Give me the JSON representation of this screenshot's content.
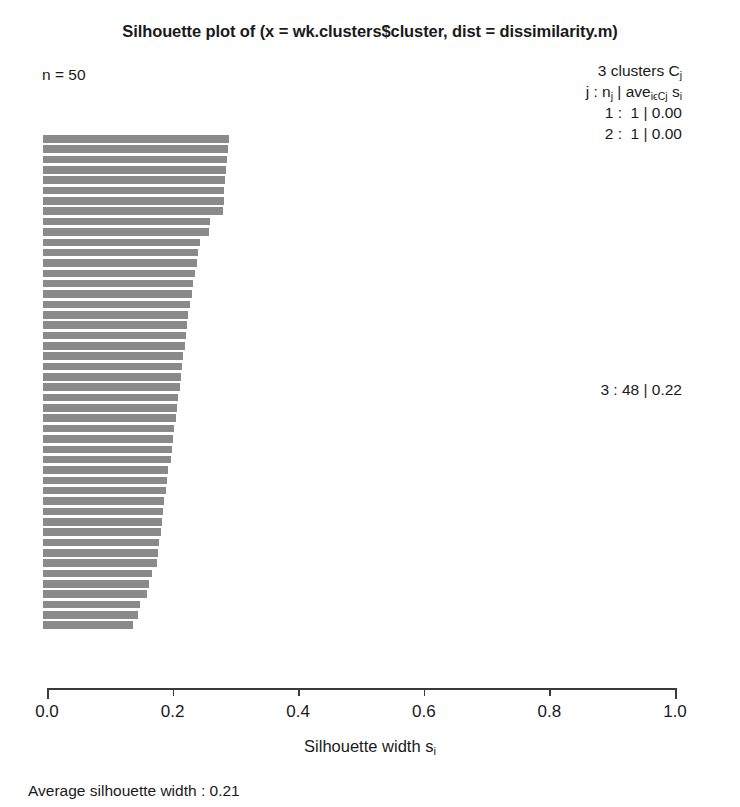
{
  "title": "Silhouette plot of (x = wk.clusters$cluster, dist = dissimilarity.m)",
  "n_label": "n = 50",
  "legend": {
    "header": "3 clusters C",
    "header_sub": "j",
    "formula_parts": [
      "j : n",
      "j",
      " | ave",
      "iϵCj",
      " s",
      "i"
    ],
    "rows": [
      {
        "label": "1 :  1 | 0.00",
        "cluster": 1,
        "size": 1,
        "avg": 0.0
      },
      {
        "label": "2 :  1 | 0.00",
        "cluster": 2,
        "size": 1,
        "avg": 0.0
      }
    ],
    "cluster3_label": "3 : 48 | 0.22",
    "cluster3": {
      "cluster": 3,
      "size": 48,
      "avg": 0.22
    }
  },
  "xlabel_main": "Silhouette width s",
  "xlabel_sub": "i",
  "average_label": "Average silhouette width : 0.21",
  "average_value": 0.21,
  "colors": {
    "bar": "#8a8a8a",
    "axis": "#3a3a3a",
    "text": "#1a1a1a",
    "background": "#ffffff"
  },
  "axis": {
    "ticks": [
      0.0,
      0.2,
      0.4,
      0.6,
      0.8,
      1.0
    ],
    "tick_labels": [
      "0.0",
      "0.2",
      "0.4",
      "0.6",
      "0.8",
      "1.0"
    ],
    "xlim": [
      0.0,
      1.0
    ],
    "grid": false
  },
  "chart_data": {
    "type": "bar",
    "orientation": "horizontal",
    "title": "Silhouette plot of (x = wk.clusters$cluster, dist = dissimilarity.m)",
    "xlabel": "Silhouette width s_i",
    "ylabel": "",
    "xlim": [
      0.0,
      1.0
    ],
    "grid": false,
    "n": 50,
    "n_clusters": 3,
    "average_silhouette_width": 0.21,
    "clusters": [
      {
        "cluster": 1,
        "size": 1,
        "avg_silhouette": 0.0,
        "values": [
          0.0
        ]
      },
      {
        "cluster": 2,
        "size": 1,
        "avg_silhouette": 0.0,
        "values": [
          0.0
        ]
      },
      {
        "cluster": 3,
        "size": 48,
        "avg_silhouette": 0.22,
        "values": [
          0.295,
          0.293,
          0.291,
          0.29,
          0.288,
          0.287,
          0.286,
          0.285,
          0.265,
          0.262,
          0.248,
          0.245,
          0.243,
          0.24,
          0.238,
          0.236,
          0.232,
          0.23,
          0.228,
          0.226,
          0.224,
          0.222,
          0.22,
          0.218,
          0.216,
          0.214,
          0.212,
          0.21,
          0.208,
          0.206,
          0.204,
          0.202,
          0.198,
          0.196,
          0.194,
          0.192,
          0.19,
          0.188,
          0.186,
          0.184,
          0.182,
          0.18,
          0.172,
          0.168,
          0.164,
          0.154,
          0.15,
          0.142
        ]
      }
    ],
    "bar_values": [
      0.295,
      0.293,
      0.291,
      0.29,
      0.288,
      0.287,
      0.286,
      0.285,
      0.265,
      0.262,
      0.248,
      0.245,
      0.243,
      0.24,
      0.238,
      0.236,
      0.232,
      0.23,
      0.228,
      0.226,
      0.224,
      0.222,
      0.22,
      0.218,
      0.216,
      0.214,
      0.212,
      0.21,
      0.208,
      0.206,
      0.204,
      0.202,
      0.198,
      0.196,
      0.194,
      0.192,
      0.19,
      0.188,
      0.186,
      0.184,
      0.182,
      0.18,
      0.172,
      0.168,
      0.164,
      0.154,
      0.15,
      0.142
    ]
  },
  "geometry": {
    "x0_px": 43,
    "x1_px": 675,
    "bars_top_px": 135,
    "bar_pitch_px": 10.35,
    "bar_height_px": 7.6
  }
}
